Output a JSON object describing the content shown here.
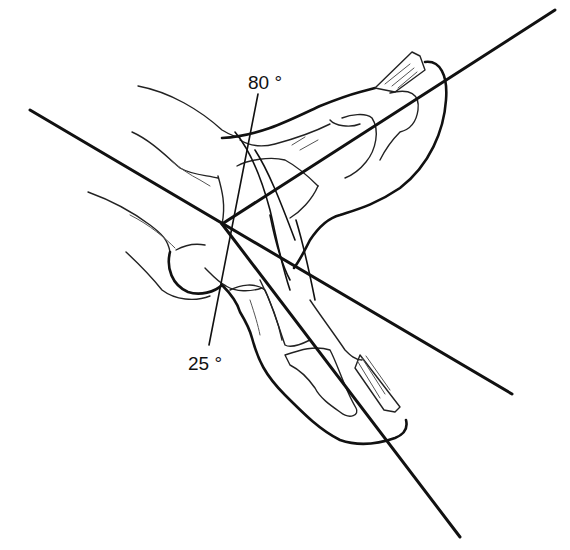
{
  "figure": {
    "labels": {
      "upper_angle": "80 °",
      "lower_angle": "25 °"
    },
    "colors": {
      "ink": "#111111",
      "background": "#ffffff"
    },
    "reference_lines": [
      {
        "name": "distal-phalanx-axis",
        "from": [
          222,
          224
        ],
        "to": [
          555,
          10
        ]
      },
      {
        "name": "proximal-axis",
        "from": [
          30,
          110
        ],
        "to": [
          512,
          394
        ]
      },
      {
        "name": "flexed-axis",
        "from": [
          222,
          224
        ],
        "to": [
          460,
          537
        ]
      },
      {
        "name": "angle-leader",
        "from": [
          258,
          94
        ],
        "to": [
          209,
          345
        ]
      }
    ]
  }
}
